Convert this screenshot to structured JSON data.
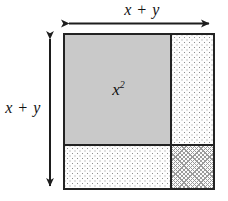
{
  "figure": {
    "type": "geometric-area-diagram",
    "background_color": "#ffffff",
    "outline_color": "#232323"
  },
  "dimensions": {
    "top_label": "x + y",
    "left_label": "x + y",
    "top_arrow": "double-headed-horizontal-arrow",
    "left_arrow": "double-headed-vertical-arrow"
  },
  "regions": [
    {
      "name": "x-squared",
      "label_base": "x",
      "label_exponent": "2",
      "fill": "solid-gray",
      "fill_color": "#c9c9c9",
      "position": "top-left"
    },
    {
      "name": "xy-top-right",
      "label_base": "",
      "label_exponent": "",
      "fill": "sparse-dotted",
      "fill_color": "#fdfdfd",
      "position": "top-right"
    },
    {
      "name": "xy-bottom-left",
      "label_base": "",
      "label_exponent": "",
      "fill": "sparse-dotted",
      "fill_color": "#fdfdfd",
      "position": "bottom-left"
    },
    {
      "name": "y-squared",
      "label_base": "",
      "label_exponent": "",
      "fill": "dense-crosshatch",
      "fill_color": "#fbfbfb",
      "position": "bottom-right"
    }
  ]
}
